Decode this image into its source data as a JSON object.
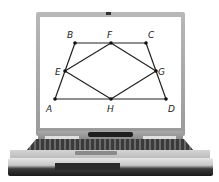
{
  "scene": {
    "description": "Laptop displaying a geometry diagram",
    "device": "laptop"
  },
  "diagram": {
    "points": [
      {
        "label": "A",
        "x": 55,
        "y": 99,
        "lx": 46,
        "ly": 112
      },
      {
        "label": "B",
        "x": 75,
        "y": 43,
        "lx": 67,
        "ly": 38
      },
      {
        "label": "C",
        "x": 146,
        "y": 43,
        "lx": 148,
        "ly": 38
      },
      {
        "label": "D",
        "x": 166,
        "y": 99,
        "lx": 168,
        "ly": 112
      },
      {
        "label": "E",
        "x": 65,
        "y": 71,
        "lx": 55,
        "ly": 75
      },
      {
        "label": "F",
        "x": 111,
        "y": 43,
        "lx": 107,
        "ly": 38
      },
      {
        "label": "G",
        "x": 156,
        "y": 71,
        "lx": 158,
        "ly": 75
      },
      {
        "label": "H",
        "x": 111,
        "y": 99,
        "lx": 107,
        "ly": 112
      }
    ],
    "segments": [
      [
        "A",
        "B"
      ],
      [
        "B",
        "C"
      ],
      [
        "C",
        "D"
      ],
      [
        "D",
        "A"
      ],
      [
        "E",
        "F"
      ],
      [
        "F",
        "G"
      ],
      [
        "G",
        "H"
      ],
      [
        "H",
        "E"
      ]
    ],
    "shapes": {
      "outer": "trapezoid ABCD",
      "inner": "quadrilateral EFGH (midpoints)"
    },
    "colors": {
      "line": "#222222",
      "point": "#111111",
      "screen": "#ffffff"
    }
  }
}
